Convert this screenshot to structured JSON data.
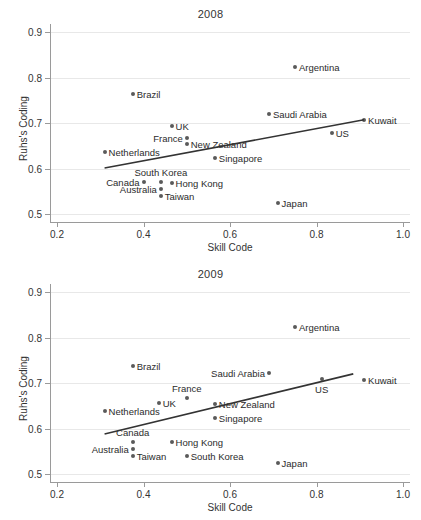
{
  "figure": {
    "xlabel": "Skill Code",
    "ylabel": "Ruhs's Coding",
    "xticks": [
      "0.2",
      "0.4",
      "0.6",
      "0.8",
      "1.0"
    ],
    "yticks": [
      "0.9",
      "0.8",
      "0.7",
      "0.6",
      "0.5"
    ],
    "marker_color": "#5a5a5a",
    "line_color": "#333333",
    "grid_color": "#e8e8e8"
  },
  "chart_data": [
    {
      "type": "scatter",
      "title": "2008",
      "xlabel": "Skill Code",
      "ylabel": "Ruhs's Coding",
      "xlim": [
        0.2,
        1.0
      ],
      "ylim": [
        0.5,
        0.9
      ],
      "xticks": [
        0.2,
        0.4,
        0.6,
        0.8,
        1.0
      ],
      "yticks": [
        0.5,
        0.6,
        0.7,
        0.8,
        0.9
      ],
      "grid": "horizontal",
      "legend": "none",
      "points": [
        {
          "label": "Argentina",
          "x": 0.75,
          "y": 0.822,
          "label_pos": "right"
        },
        {
          "label": "Brazil",
          "x": 0.375,
          "y": 0.763,
          "label_pos": "right"
        },
        {
          "label": "Saudi Arabia",
          "x": 0.69,
          "y": 0.72,
          "label_pos": "right"
        },
        {
          "label": "Kuwait",
          "x": 0.91,
          "y": 0.707,
          "label_pos": "right"
        },
        {
          "label": "UK",
          "x": 0.465,
          "y": 0.694,
          "label_pos": "right"
        },
        {
          "label": "US",
          "x": 0.835,
          "y": 0.679,
          "label_pos": "right"
        },
        {
          "label": "France",
          "x": 0.5,
          "y": 0.668,
          "label_pos": "left"
        },
        {
          "label": "New Zealand",
          "x": 0.5,
          "y": 0.653,
          "label_pos": "right"
        },
        {
          "label": "Netherlands",
          "x": 0.31,
          "y": 0.637,
          "label_pos": "right"
        },
        {
          "label": "Singapore",
          "x": 0.565,
          "y": 0.623,
          "label_pos": "right"
        },
        {
          "label": "Canada",
          "x": 0.4,
          "y": 0.57,
          "label_pos": "left"
        },
        {
          "label": "South Korea",
          "x": 0.44,
          "y": 0.57,
          "label_pos": "above"
        },
        {
          "label": "Hong Kong",
          "x": 0.465,
          "y": 0.568,
          "label_pos": "right"
        },
        {
          "label": "Australia",
          "x": 0.44,
          "y": 0.555,
          "label_pos": "left"
        },
        {
          "label": "Taiwan",
          "x": 0.44,
          "y": 0.539,
          "label_pos": "right"
        },
        {
          "label": "Japan",
          "x": 0.71,
          "y": 0.524,
          "label_pos": "right"
        }
      ],
      "fit_line": {
        "x0": 0.31,
        "y0": 0.601,
        "x1": 0.91,
        "y1": 0.707
      }
    },
    {
      "type": "scatter",
      "title": "2009",
      "xlabel": "Skill Code",
      "ylabel": "Ruhs's Coding",
      "xlim": [
        0.2,
        1.0
      ],
      "ylim": [
        0.5,
        0.9
      ],
      "xticks": [
        0.2,
        0.4,
        0.6,
        0.8,
        1.0
      ],
      "yticks": [
        0.5,
        0.6,
        0.7,
        0.8,
        0.9
      ],
      "grid": "horizontal",
      "legend": "none",
      "points": [
        {
          "label": "Argentina",
          "x": 0.75,
          "y": 0.823,
          "label_pos": "right"
        },
        {
          "label": "Brazil",
          "x": 0.375,
          "y": 0.737,
          "label_pos": "right"
        },
        {
          "label": "Saudi Arabia",
          "x": 0.69,
          "y": 0.722,
          "label_pos": "left"
        },
        {
          "label": "Kuwait",
          "x": 0.91,
          "y": 0.707,
          "label_pos": "right"
        },
        {
          "label": "US",
          "x": 0.812,
          "y": 0.709,
          "label_pos": "below"
        },
        {
          "label": "France",
          "x": 0.5,
          "y": 0.668,
          "label_pos": "above"
        },
        {
          "label": "New Zealand",
          "x": 0.565,
          "y": 0.653,
          "label_pos": "right"
        },
        {
          "label": "UK",
          "x": 0.435,
          "y": 0.655,
          "label_pos": "right"
        },
        {
          "label": "Netherlands",
          "x": 0.31,
          "y": 0.639,
          "label_pos": "right"
        },
        {
          "label": "Singapore",
          "x": 0.565,
          "y": 0.623,
          "label_pos": "right"
        },
        {
          "label": "Canada",
          "x": 0.375,
          "y": 0.57,
          "label_pos": "above"
        },
        {
          "label": "Hong Kong",
          "x": 0.465,
          "y": 0.57,
          "label_pos": "right"
        },
        {
          "label": "Australia",
          "x": 0.375,
          "y": 0.555,
          "label_pos": "left"
        },
        {
          "label": "Taiwan",
          "x": 0.375,
          "y": 0.539,
          "label_pos": "right"
        },
        {
          "label": "South Korea",
          "x": 0.5,
          "y": 0.539,
          "label_pos": "right"
        },
        {
          "label": "Japan",
          "x": 0.71,
          "y": 0.524,
          "label_pos": "right"
        }
      ],
      "fit_line": {
        "x0": 0.31,
        "y0": 0.588,
        "x1": 0.885,
        "y1": 0.72
      }
    }
  ]
}
